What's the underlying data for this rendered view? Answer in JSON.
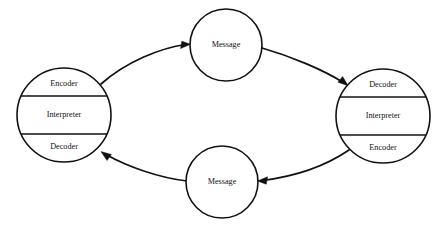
{
  "diagram": {
    "background_color": "#ffffff",
    "stroke_color": "#111111",
    "nodes": {
      "left_party": {
        "name": "left-party",
        "segments": [
          {
            "label": "Encoder"
          },
          {
            "label": "Interpreter"
          },
          {
            "label": "Decoder"
          }
        ]
      },
      "right_party": {
        "name": "right-party",
        "segments": [
          {
            "label": "Decoder"
          },
          {
            "label": "Interpreter"
          },
          {
            "label": "Encoder"
          }
        ]
      },
      "top_message": {
        "label": "Message"
      },
      "bottom_message": {
        "label": "Message"
      }
    },
    "arrows": [
      {
        "name": "left-to-top-message",
        "from": "left_party",
        "to": "top_message"
      },
      {
        "name": "top-message-to-right",
        "from": "top_message",
        "to": "right_party"
      },
      {
        "name": "right-to-bottom-message",
        "from": "right_party",
        "to": "bottom_message"
      },
      {
        "name": "bottom-message-to-left",
        "from": "bottom_message",
        "to": "left_party"
      }
    ]
  }
}
